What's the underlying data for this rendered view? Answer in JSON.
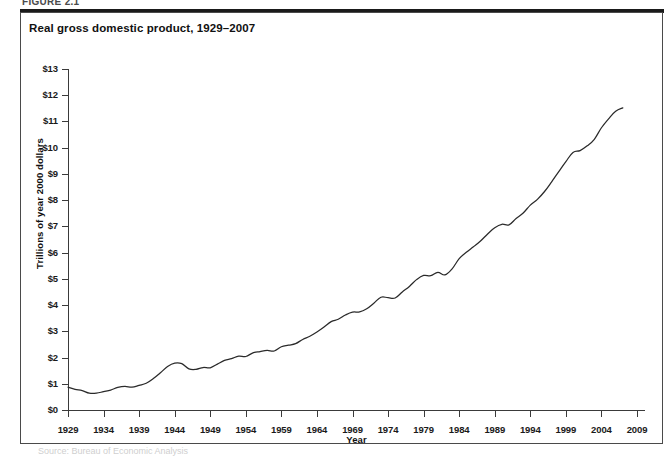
{
  "figure": {
    "caption": "FIGURE 2.1",
    "title": "Real gross domestic product, 1929–2007",
    "source_note": "Source: Bureau of Economic Analysis"
  },
  "chart_data": {
    "type": "line",
    "title": "Real gross domestic product, 1929–2007",
    "xlabel": "Year",
    "ylabel": "Trillions of year 2000 dollars",
    "xlim": [
      1929,
      2009
    ],
    "ylim": [
      0,
      13
    ],
    "xticks": [
      1929,
      1934,
      1939,
      1944,
      1949,
      1954,
      1959,
      1964,
      1969,
      1974,
      1979,
      1984,
      1989,
      1994,
      1999,
      2004,
      2009
    ],
    "xtick_labels": [
      "1929",
      "1934",
      "1939",
      "1944",
      "1949",
      "1954",
      "1959",
      "1964",
      "1969",
      "1974",
      "1979",
      "1984",
      "1989",
      "1994",
      "1999",
      "2004",
      "2009"
    ],
    "yticks": [
      0,
      1,
      2,
      3,
      4,
      5,
      6,
      7,
      8,
      9,
      10,
      11,
      12,
      13
    ],
    "ytick_labels": [
      "$0",
      "$1",
      "$2",
      "$3",
      "$4",
      "$5",
      "$6",
      "$7",
      "$8",
      "$9",
      "$10",
      "$11",
      "$12",
      "$13"
    ],
    "grid": false,
    "legend": false,
    "line_color": "#2a2a2a",
    "series": [
      {
        "name": "Real GDP",
        "x": [
          1929,
          1930,
          1931,
          1932,
          1933,
          1934,
          1935,
          1936,
          1937,
          1938,
          1939,
          1940,
          1941,
          1942,
          1943,
          1944,
          1945,
          1946,
          1947,
          1948,
          1949,
          1950,
          1951,
          1952,
          1953,
          1954,
          1955,
          1956,
          1957,
          1958,
          1959,
          1960,
          1961,
          1962,
          1963,
          1964,
          1965,
          1966,
          1967,
          1968,
          1969,
          1970,
          1971,
          1972,
          1973,
          1974,
          1975,
          1976,
          1977,
          1978,
          1979,
          1980,
          1981,
          1982,
          1983,
          1984,
          1985,
          1986,
          1987,
          1988,
          1989,
          1990,
          1991,
          1992,
          1993,
          1994,
          1995,
          1996,
          1997,
          1998,
          1999,
          2000,
          2001,
          2002,
          2003,
          2004,
          2005,
          2006,
          2007
        ],
        "values": [
          0.87,
          0.79,
          0.74,
          0.64,
          0.64,
          0.7,
          0.76,
          0.86,
          0.9,
          0.87,
          0.94,
          1.02,
          1.2,
          1.42,
          1.66,
          1.79,
          1.77,
          1.57,
          1.55,
          1.62,
          1.61,
          1.75,
          1.89,
          1.96,
          2.05,
          2.04,
          2.18,
          2.23,
          2.27,
          2.25,
          2.41,
          2.47,
          2.53,
          2.69,
          2.81,
          2.97,
          3.16,
          3.37,
          3.46,
          3.62,
          3.73,
          3.74,
          3.86,
          4.07,
          4.3,
          4.28,
          4.27,
          4.5,
          4.71,
          4.97,
          5.13,
          5.12,
          5.25,
          5.15,
          5.38,
          5.77,
          6.01,
          6.22,
          6.44,
          6.71,
          6.95,
          7.08,
          7.06,
          7.3,
          7.51,
          7.81,
          8.03,
          8.33,
          8.7,
          9.09,
          9.47,
          9.82,
          9.89,
          10.07,
          10.32,
          10.76,
          11.1,
          11.39,
          11.52
        ]
      }
    ]
  }
}
